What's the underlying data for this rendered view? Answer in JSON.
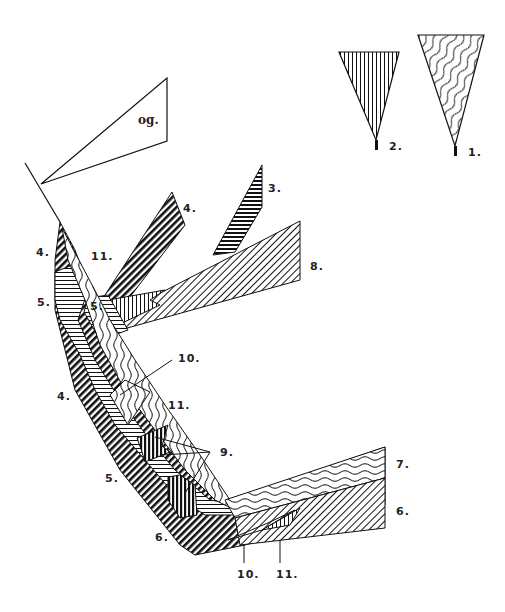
{
  "diagram": {
    "type": "fold-structure-hatched-regions",
    "legend": [
      {
        "id": "legend-1",
        "label": "1.",
        "pattern": "wavy-lines"
      },
      {
        "id": "legend-2",
        "label": "2.",
        "pattern": "vertical-lines"
      }
    ],
    "callout_triangle_label": "og.",
    "labels": {
      "l3": "3.",
      "l4_top": "4.",
      "l4_left": "4.",
      "l4_lower": "4.",
      "l5_left": "5.",
      "l5_inner": "5.",
      "l5_lower": "5.",
      "l6_left": "6.",
      "l6_right": "6.",
      "l7": "7.",
      "l8": "8.",
      "l9": "9.",
      "l10_mid": "10.",
      "l10_bottom": "10.",
      "l11_top": "11.",
      "l11_mid": "11.",
      "l11_bottom": "11."
    },
    "colors": {
      "ink": "#111111",
      "background": "#ffffff"
    }
  }
}
